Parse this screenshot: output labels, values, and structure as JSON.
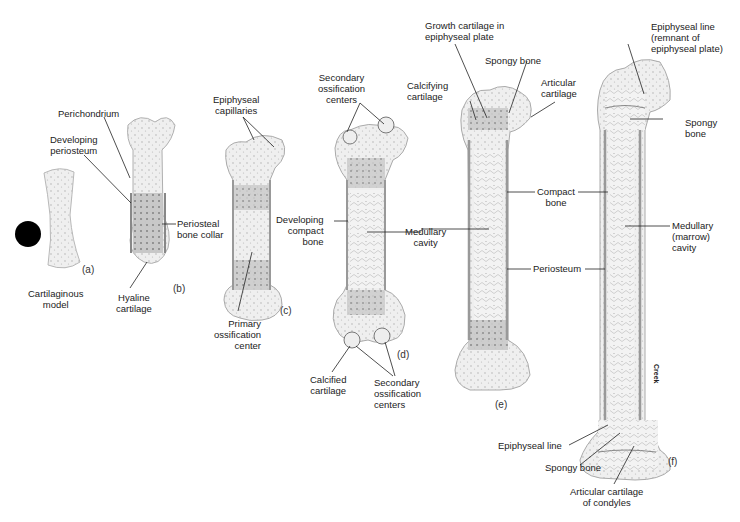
{
  "figure": {
    "stages": [
      {
        "id": "a",
        "label": "(a)",
        "caption": "Cartilaginous\nmodel"
      },
      {
        "id": "b",
        "label": "(b)"
      },
      {
        "id": "c",
        "label": "(c)"
      },
      {
        "id": "d",
        "label": "(d)"
      },
      {
        "id": "e",
        "label": "(e)"
      },
      {
        "id": "f",
        "label": "(f)"
      }
    ],
    "labels": {
      "perichondrium": "Perichondrium",
      "developing_periosteum": "Developing\nperiosteum",
      "periosteal_bone_collar": "Periosteal\nbone collar",
      "hyaline_cartilage": "Hyaline\ncartilage",
      "epiphyseal_capillaries": "Epiphyseal\ncapillaries",
      "primary_ossification_center": "Primary\nossification\ncenter",
      "secondary_ossification_centers_top": "Secondary\nossification\ncenters",
      "developing_compact_bone": "Developing\ncompact\nbone",
      "medullary_cavity_d": "Medullary\ncavity",
      "calcified_cartilage": "Calcified\ncartilage",
      "secondary_ossification_centers_bottom": "Secondary\nossification\ncenters",
      "growth_cartilage": "Growth cartilage in\nepiphyseal plate",
      "spongy_bone_e": "Spongy bone",
      "calcifying_cartilage": "Calcifying\ncartilage",
      "articular_cartilage_e": "Articular\ncartilage",
      "compact_bone": "Compact\nbone",
      "periosteum": "Periosteum",
      "epiphyseal_line_top": "Epiphyseal line\n(remnant of\nepiphyseal plate)",
      "spongy_bone_f_top": "Spongy\nbone",
      "medullary_marrow_cavity": "Medullary\n(marrow)\ncavity",
      "epiphyseal_line_bottom": "Epiphyseal line",
      "spongy_bone_f_bottom": "Spongy bone",
      "articular_cartilage_condyles": "Articular cartilage\nof condyles"
    },
    "credit": "Creek",
    "colors": {
      "cartilage": "#ececec",
      "bone_dark": "#bdbdbd",
      "outline": "#8a8a8a",
      "line": "#222222",
      "marker": "#000000"
    }
  }
}
